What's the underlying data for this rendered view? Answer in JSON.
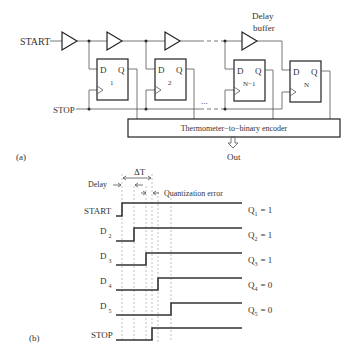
{
  "part_a": {
    "label": "(a)",
    "start_label": "START",
    "stop_label": "STOP",
    "delay_buffer_label_line1": "Delay",
    "delay_buffer_label_line2": "buffer",
    "flipflops": [
      {
        "d": "D",
        "q": "Q",
        "index": "1"
      },
      {
        "d": "D",
        "q": "Q",
        "index": "2"
      },
      {
        "d": "D",
        "q": "Q",
        "index": "N−1"
      },
      {
        "d": "D",
        "q": "Q",
        "index": "N"
      }
    ],
    "ellipsis": "...",
    "encoder_label": "Thermometer−to−binary encoder",
    "out_label": "Out"
  },
  "part_b": {
    "label": "(b)",
    "delta_t": "ΔT",
    "delay_label": "Delay",
    "quant_error_label": "Quantization error",
    "signals": [
      {
        "name": "START",
        "sub": "",
        "q": "Q",
        "q_sub": "1",
        "q_val": "= 1",
        "rise_x": 122
      },
      {
        "name": "D",
        "sub": "2",
        "q": "Q",
        "q_sub": "2",
        "q_val": "= 1",
        "rise_x": 134
      },
      {
        "name": "D",
        "sub": "3",
        "q": "Q",
        "q_sub": "3",
        "q_val": "= 1",
        "rise_x": 146
      },
      {
        "name": "D",
        "sub": "4",
        "q": "Q",
        "q_sub": "4",
        "q_val": "= 0",
        "rise_x": 158
      },
      {
        "name": "D",
        "sub": "5",
        "q": "Q",
        "q_sub": "5",
        "q_val": "= 0",
        "rise_x": 171
      },
      {
        "name": "STOP",
        "sub": "",
        "q": "",
        "q_sub": "",
        "q_val": "",
        "rise_x": 152
      }
    ]
  }
}
